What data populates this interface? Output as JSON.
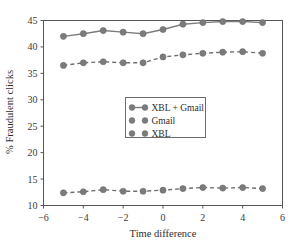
{
  "chart_data": {
    "type": "line",
    "title": "",
    "xlabel": "Time difference",
    "ylabel": "% Fraudulent clicks",
    "xlim": [
      -6,
      6
    ],
    "ylim": [
      10,
      45
    ],
    "xticks": [
      -6,
      -4,
      -2,
      0,
      2,
      4,
      6
    ],
    "xtick_labels": [
      "−6",
      "−4",
      "−2",
      "0",
      "2",
      "4",
      "6"
    ],
    "yticks": [
      10,
      15,
      20,
      25,
      30,
      35,
      40,
      45
    ],
    "ytick_labels": [
      "10",
      "15",
      "20",
      "25",
      "30",
      "35",
      "40",
      "45"
    ],
    "grid": false,
    "legend_position": "center",
    "x": [
      -5,
      -4,
      -3,
      -2,
      -1,
      0,
      1,
      2,
      3,
      4,
      5
    ],
    "series": [
      {
        "name": "XBL + Gmail",
        "style": "solid",
        "color": "#7d7d7d",
        "values": [
          42.0,
          42.5,
          43.1,
          42.8,
          42.5,
          43.3,
          44.3,
          44.6,
          44.8,
          44.8,
          44.6
        ]
      },
      {
        "name": "Gmail",
        "style": "dashed",
        "color": "#6f6f6f",
        "values": [
          36.5,
          37.0,
          37.2,
          37.0,
          37.0,
          38.1,
          38.5,
          38.8,
          39.0,
          39.1,
          38.8
        ]
      },
      {
        "name": "XBL",
        "style": "dashed",
        "color": "#6f6f6f",
        "values": [
          12.4,
          12.6,
          13.0,
          12.7,
          12.7,
          12.9,
          13.2,
          13.4,
          13.3,
          13.4,
          13.2
        ]
      }
    ]
  },
  "legend": {
    "entries": [
      {
        "label": "XBL + Gmail"
      },
      {
        "label": "Gmail"
      },
      {
        "label": "XBL"
      }
    ]
  }
}
